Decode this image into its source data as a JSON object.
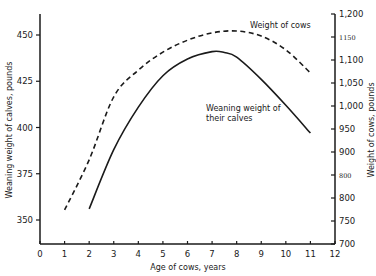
{
  "chart_data": {
    "type": "line",
    "title": "",
    "xlabel": "Age of cows, years",
    "ylabel_left": "Weaning weight of calves, pounds",
    "ylabel_right": "Weight of cows, pounds",
    "xlim": [
      0,
      12
    ],
    "ylim_left": [
      335,
      462
    ],
    "ylim_right": [
      700,
      1200
    ],
    "x_ticks": [
      "0",
      "1",
      "2",
      "3",
      "4",
      "5",
      "6",
      "7",
      "8",
      "9",
      "10",
      "11",
      "12"
    ],
    "y_ticks_left": [
      "350",
      "375",
      "400",
      "425",
      "450"
    ],
    "y_ticks_right": [
      "700",
      "750",
      "800",
      "800",
      "900",
      "950",
      "1,000",
      "1,050",
      "1,100",
      "1150",
      "1,200"
    ],
    "grid": false,
    "legend": "none (direct line annotations)",
    "series": [
      {
        "name": "Weight of cows",
        "axis": "right",
        "style": "dashed",
        "x": [
          1,
          2,
          3,
          4,
          5,
          6,
          7,
          8,
          9,
          10,
          11
        ],
        "values": [
          774,
          883,
          1020,
          1078,
          1117,
          1143,
          1159,
          1163,
          1152,
          1122,
          1072
        ]
      },
      {
        "name": "Weaning weight of their calves",
        "axis": "left",
        "style": "solid",
        "x": [
          2,
          3,
          4,
          5,
          6,
          7,
          7.5,
          8,
          9,
          10,
          11
        ],
        "values": [
          356,
          388,
          411,
          428,
          437,
          441,
          440.5,
          438,
          426,
          412,
          397
        ]
      }
    ],
    "annotations": [
      {
        "text": "Weight of cows",
        "near": "dashed curve peak"
      },
      {
        "text": "Weaning weight of",
        "line2": "their calves",
        "near": "solid curve descending"
      }
    ]
  },
  "labels": {
    "xlabel": "Age of cows, years",
    "ylabel_left": "Weaning weight of calves, pounds",
    "ylabel_right": "Weight of cows, pounds",
    "annot_cows": "Weight of cows",
    "annot_calves_1": "Weaning weight of",
    "annot_calves_2": "their calves"
  },
  "colors": {
    "ink": "#1a1a1a",
    "background": "#ffffff"
  }
}
